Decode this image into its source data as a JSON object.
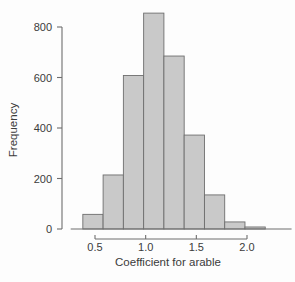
{
  "chart_data": {
    "type": "bar",
    "title": "",
    "subtitle": "",
    "xlabel": "Coefficient for arable",
    "ylabel": "Frequency",
    "xlim": [
      0.28,
      2.42
    ],
    "ylim": [
      0,
      880
    ],
    "xticks": [
      0.5,
      1.0,
      1.5,
      2.0
    ],
    "xtick_labels": [
      "0.5",
      "1.0",
      "1.5",
      "2.0"
    ],
    "yticks": [
      0,
      200,
      400,
      600,
      800
    ],
    "ytick_labels": [
      "0",
      "200",
      "400",
      "600",
      "800"
    ],
    "grid": false,
    "legend": null,
    "bin_width": 0.2,
    "bin_edges": [
      0.38,
      0.58,
      0.78,
      0.98,
      1.18,
      1.38,
      1.58,
      1.78,
      1.98,
      2.18,
      2.38
    ],
    "categories": [
      "0.38-0.58",
      "0.58-0.78",
      "0.78-0.98",
      "0.98-1.18",
      "1.18-1.38",
      "1.38-1.58",
      "1.58-1.78",
      "1.78-1.98",
      "1.98-2.18",
      "2.18-2.38"
    ],
    "values": [
      58,
      214,
      608,
      855,
      685,
      372,
      135,
      28,
      8,
      0
    ],
    "bar_fill_color": "#c9c9c9",
    "bar_edge_color": "#6e6e6e",
    "axis_color": "#6e6e6e",
    "text_color": "#3b3b3b"
  },
  "axes": {
    "x_label": "Coefficient for arable",
    "y_label": "Frequency"
  }
}
